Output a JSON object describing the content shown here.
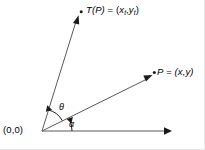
{
  "figure": {
    "type": "vector-rotation-diagram",
    "background_color": "#ffffff",
    "line_color": "#5a5a5a",
    "text_color": "#000000",
    "labels": {
      "origin": "(0,0)",
      "transformed_point_name": "T(P)",
      "transformed_point_equals": " = ",
      "transformed_point_open": "(",
      "transformed_point_x": "x",
      "transformed_point_x_sub": "t",
      "transformed_point_comma": ",",
      "transformed_point_y": "y",
      "transformed_point_y_sub": "t",
      "transformed_point_close": ")",
      "point_name": "P",
      "point_equals": " = ",
      "point_coords": "(x,y)",
      "angle_theta": "θ",
      "angle_alpha": "α"
    },
    "geometry": {
      "origin": [
        42,
        131
      ],
      "x_axis_end": [
        170,
        131
      ],
      "point_p_tip": [
        151,
        76
      ],
      "point_tp_tip": [
        78,
        16
      ],
      "point_p_dot": [
        154,
        73
      ],
      "point_tp_dot": [
        81,
        12
      ],
      "alpha_arc_radius": 30,
      "theta_arc_radius": 22,
      "alpha_degrees": 23,
      "theta_degrees": 73
    }
  }
}
